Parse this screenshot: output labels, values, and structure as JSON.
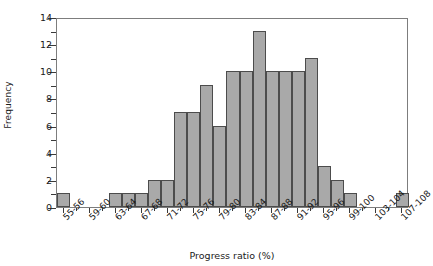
{
  "chart_data": {
    "type": "bar",
    "title": "",
    "xlabel": "Progress ratio (%)",
    "ylabel": "Frequency",
    "ylim": [
      0,
      14
    ],
    "ytick_values": [
      0,
      2,
      4,
      6,
      8,
      10,
      12,
      14
    ],
    "yminor_values": [
      1,
      3,
      5,
      7,
      9,
      11,
      13
    ],
    "grid": false,
    "legend": null,
    "bar_color": "#a9a9a9",
    "bar_edge_color": "#4c4c4c",
    "axis_color": "#7d7d7d",
    "categories": [
      "55-56",
      "57-58",
      "59-60",
      "61-62",
      "63-64",
      "65-66",
      "67-68",
      "69-70",
      "71-72",
      "73-74",
      "75-76",
      "77-78",
      "79-80",
      "81-82",
      "83-84",
      "85-86",
      "87-88",
      "89-90",
      "91-92",
      "93-94",
      "95-96",
      "97-98",
      "99-100",
      "101-102",
      "103-104",
      "105-106",
      "107-108"
    ],
    "values": [
      1,
      0,
      0,
      0,
      1,
      1,
      1,
      2,
      2,
      7,
      7,
      9,
      6,
      10,
      10,
      13,
      10,
      10,
      10,
      11,
      3,
      2,
      1,
      0,
      0,
      0,
      1
    ],
    "labeled_ticks": [
      "55-56",
      "59-60",
      "63-64",
      "67-68",
      "71-72",
      "75-76",
      "79-80",
      "83-84",
      "87-88",
      "91-92",
      "95-96",
      "99-100",
      "103-104",
      "107-108"
    ]
  }
}
